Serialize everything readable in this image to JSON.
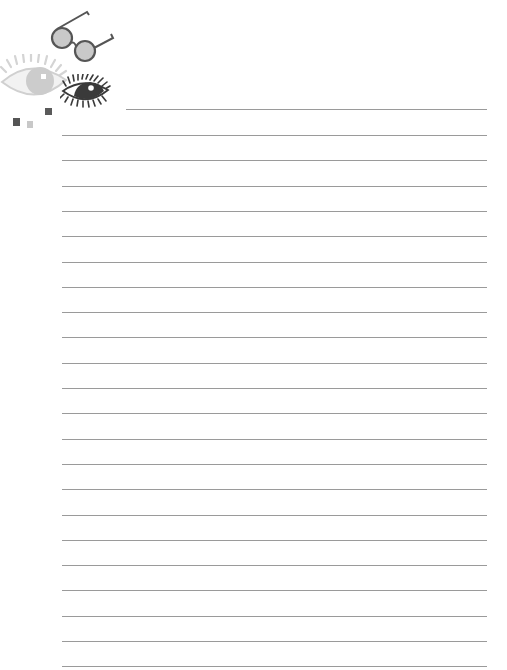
{
  "page": {
    "type": "lined-notepaper",
    "background": "#ffffff",
    "line_color": "#9a9a9a",
    "line_count": 23
  },
  "decorations": {
    "icons": [
      "glasses-icon",
      "light-eye-icon",
      "dark-eye-icon"
    ],
    "squares": [
      {
        "name": "dark-square-1",
        "color": "#555555"
      },
      {
        "name": "light-square",
        "color": "#c8c8c8"
      },
      {
        "name": "dark-square-2",
        "color": "#5a5a5a"
      }
    ]
  }
}
